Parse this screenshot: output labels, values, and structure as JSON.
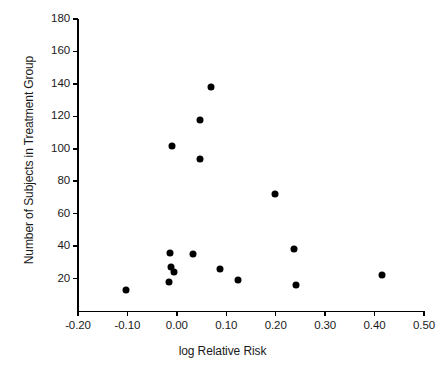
{
  "chart_data": {
    "type": "scatter",
    "title": "",
    "xlabel": "log Relative Risk",
    "ylabel": "Number of Subjects in Treatment Group",
    "xlim": [
      -0.2,
      0.5
    ],
    "ylim": [
      0,
      180
    ],
    "grid": false,
    "legend": null,
    "xticks": [
      -0.2,
      -0.1,
      0.0,
      0.1,
      0.2,
      0.3,
      0.4,
      0.5
    ],
    "xtick_labels": [
      "-0.20",
      "-0.10",
      "0.00",
      "0.10",
      "0.20",
      "0.30",
      "0.40",
      "0.50"
    ],
    "yticks": [
      20,
      40,
      60,
      80,
      100,
      120,
      140,
      160,
      180
    ],
    "ytick_labels": [
      "20",
      "40",
      "60",
      "80",
      "100",
      "120",
      "140",
      "160",
      "180"
    ],
    "marker": "filled-circle",
    "marker_color": "#000000",
    "points": [
      {
        "x": -0.102,
        "y": 13
      },
      {
        "x": -0.015,
        "y": 18
      },
      {
        "x": -0.012,
        "y": 27
      },
      {
        "x": -0.006,
        "y": 24
      },
      {
        "x": -0.013,
        "y": 36
      },
      {
        "x": -0.01,
        "y": 102
      },
      {
        "x": 0.033,
        "y": 35
      },
      {
        "x": 0.046,
        "y": 94
      },
      {
        "x": 0.046,
        "y": 118
      },
      {
        "x": 0.07,
        "y": 138
      },
      {
        "x": 0.087,
        "y": 26
      },
      {
        "x": 0.124,
        "y": 19
      },
      {
        "x": 0.199,
        "y": 72
      },
      {
        "x": 0.236,
        "y": 38
      },
      {
        "x": 0.241,
        "y": 16
      },
      {
        "x": 0.415,
        "y": 22
      }
    ]
  },
  "axes": {
    "x_title": "log Relative Risk",
    "y_title": "Number of Subjects in Treatment Group"
  }
}
